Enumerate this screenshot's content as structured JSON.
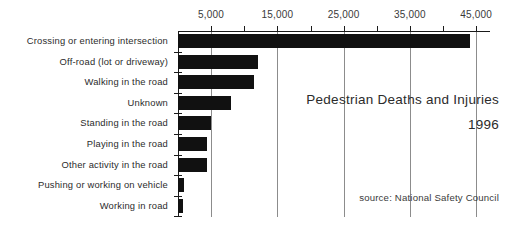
{
  "chart_data": {
    "type": "bar",
    "orientation": "horizontal",
    "title": "Pedestrian Deaths and Injuries",
    "subtitle": "1996",
    "source": "source: National Safety Council",
    "xlabel": "",
    "ylabel": "",
    "xlim": [
      0,
      47000
    ],
    "grid": true,
    "legend": null,
    "categories": [
      "Crossing or entering intersection",
      "Off-road (lot or driveway)",
      "Walking in the road",
      "Unknown",
      "Standing in the road",
      "Playing in the road",
      "Other activity in the road",
      "Pushing or working on vehicle",
      "Working in road"
    ],
    "values": [
      44000,
      12000,
      11400,
      8000,
      5000,
      4400,
      4400,
      900,
      750
    ],
    "tick_labels": [
      "5,000",
      "15,000",
      "25,000",
      "35,000",
      "45,000"
    ],
    "tick_values": [
      5000,
      15000,
      25000,
      35000,
      45000
    ],
    "minor_tick_values": [
      10000,
      20000,
      30000,
      40000
    ],
    "bar_color": "#111111",
    "axis_color": "#1a1a1a",
    "grid_color": "#8c8c8c",
    "text_color": "#2b2b2b"
  }
}
